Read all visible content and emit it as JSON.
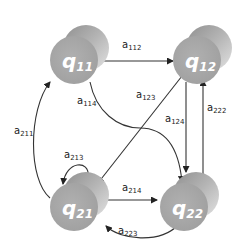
{
  "diagram": {
    "type": "state-transition-graph",
    "colors": {
      "node_front": "#a9a9a9",
      "node_back_light": "#d4d4d4",
      "node_back_dark": "#9a9a9a",
      "node_text": "#ffffff",
      "edge": "#333333",
      "label": "#222222"
    },
    "nodes": [
      {
        "id": "q11",
        "base": "q",
        "sub": "11"
      },
      {
        "id": "q12",
        "base": "q",
        "sub": "12"
      },
      {
        "id": "q21",
        "base": "q",
        "sub": "21"
      },
      {
        "id": "q22",
        "base": "q",
        "sub": "22"
      }
    ],
    "edges": [
      {
        "id": "a112",
        "base": "a",
        "sub": "112",
        "from": "q11",
        "to": "q12"
      },
      {
        "id": "a114",
        "base": "a",
        "sub": "114",
        "from": "q11",
        "to": "q22"
      },
      {
        "id": "a123",
        "base": "a",
        "sub": "123",
        "from": "q12",
        "to": "q21"
      },
      {
        "id": "a124",
        "base": "a",
        "sub": "124",
        "from": "q12",
        "to": "q22"
      },
      {
        "id": "a222",
        "base": "a",
        "sub": "222",
        "from": "q22",
        "to": "q12"
      },
      {
        "id": "a211",
        "base": "a",
        "sub": "211",
        "from": "q21",
        "to": "q11"
      },
      {
        "id": "a213",
        "base": "a",
        "sub": "213",
        "from": "q21",
        "to": "q21"
      },
      {
        "id": "a214",
        "base": "a",
        "sub": "214",
        "from": "q21",
        "to": "q22"
      },
      {
        "id": "a223",
        "base": "a",
        "sub": "223",
        "from": "q22",
        "to": "q21"
      }
    ]
  }
}
